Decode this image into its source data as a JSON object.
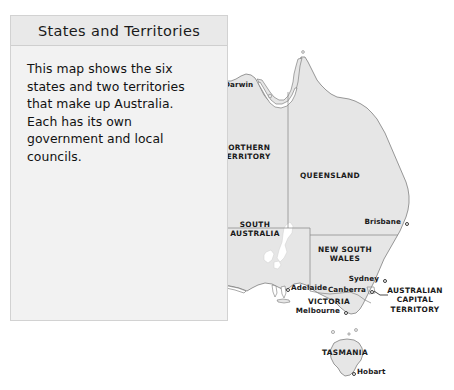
{
  "panel": {
    "title": "States and Territories",
    "body": "This map shows the six states and two territories that make up Australia. Each has its own government and local councils."
  },
  "map": {
    "region_name": "Australia",
    "land_color": "#e6e6e6",
    "border_color": "#8a8a8a",
    "coast_color": "#6e6e6e",
    "background_color": "#ffffff",
    "states": [
      {
        "name": "WESTERN AUSTRALIA",
        "x": 155,
        "y": 209,
        "lines": [
          "WESTERN AUSTRALIA"
        ]
      },
      {
        "name": "NORTHERN TERRITORY",
        "x": 246,
        "y": 152,
        "lines": [
          "NORTHERN",
          "TERRITORY"
        ]
      },
      {
        "name": "QUEENSLAND",
        "x": 330,
        "y": 176,
        "lines": [
          "QUEENSLAND"
        ]
      },
      {
        "name": "SOUTH AUSTRALIA",
        "x": 255,
        "y": 229,
        "lines": [
          "SOUTH",
          "AUSTRALIA"
        ]
      },
      {
        "name": "NEW SOUTH WALES",
        "x": 345,
        "y": 254,
        "lines": [
          "NEW SOUTH",
          "WALES"
        ]
      },
      {
        "name": "VICTORIA",
        "x": 329,
        "y": 302,
        "lines": [
          "VICTORIA"
        ]
      },
      {
        "name": "TASMANIA",
        "x": 345,
        "y": 353,
        "lines": [
          "TASMANIA"
        ]
      },
      {
        "name": "AUSTRALIAN CAPITAL TERRITORY",
        "x": 415,
        "y": 300,
        "lines": [
          "AUSTRALIAN",
          "CAPITAL",
          "TERRITORY"
        ]
      }
    ],
    "cities": [
      {
        "name": "Darwin",
        "dot_x": 218,
        "dot_y": 85,
        "label_x": 224,
        "label_y": 80,
        "align": "left"
      },
      {
        "name": "Perth",
        "dot_x": 105,
        "dot_y": 271,
        "label_x": 111,
        "label_y": 266,
        "align": "left"
      },
      {
        "name": "Brisbane",
        "dot_x": 405,
        "dot_y": 222,
        "label_x": 401,
        "label_y": 217,
        "align": "right"
      },
      {
        "name": "Sydney",
        "dot_x": 383,
        "dot_y": 279,
        "label_x": 379,
        "label_y": 274,
        "align": "right"
      },
      {
        "name": "Adelaide",
        "dot_x": 286,
        "dot_y": 288,
        "label_x": 291,
        "label_y": 283,
        "align": "left"
      },
      {
        "name": "Canberra",
        "dot_x": 370,
        "dot_y": 290,
        "label_x": 366,
        "label_y": 285,
        "align": "right"
      },
      {
        "name": "Melbourne",
        "dot_x": 344,
        "dot_y": 311,
        "label_x": 340,
        "label_y": 306,
        "align": "right"
      },
      {
        "name": "Hobart",
        "dot_x": 352,
        "dot_y": 372,
        "label_x": 357,
        "label_y": 367,
        "align": "left"
      }
    ]
  }
}
